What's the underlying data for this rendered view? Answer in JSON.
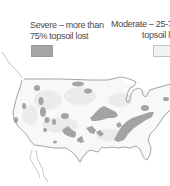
{
  "legend": {
    "severe": {
      "line1": "Severe – more than",
      "line2": "75% topsoil lost",
      "color": "#a6a6a6"
    },
    "moderate": {
      "line1": "Moderate – 25-75%",
      "line2": "topsoil lost",
      "color": "#f2f2f2"
    }
  },
  "map": {
    "subject": "Contiguous United States topsoil erosion",
    "outline_color": "#8c8c8c",
    "land_color": "#f7f7f7",
    "severe_color": "#9e9e9e",
    "moderate_color": "#e6e6e6"
  }
}
